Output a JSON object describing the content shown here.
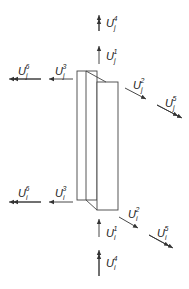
{
  "diagram": {
    "stroke_color": "#333333",
    "top_node": {
      "subscript": "j",
      "labels": [
        {
          "id": "U4",
          "base": "U",
          "sub": "j",
          "sup": "4",
          "direction": "up",
          "arrow": "double"
        },
        {
          "id": "U1",
          "base": "U",
          "sub": "j",
          "sup": "1",
          "direction": "up",
          "arrow": "single"
        },
        {
          "id": "U6",
          "base": "U",
          "sub": "j",
          "sup": "6",
          "direction": "left",
          "arrow": "double"
        },
        {
          "id": "U3",
          "base": "U",
          "sub": "j",
          "sup": "3",
          "direction": "left",
          "arrow": "single"
        },
        {
          "id": "U2",
          "base": "U",
          "sub": "j",
          "sup": "2",
          "direction": "down-right",
          "arrow": "single"
        },
        {
          "id": "U5",
          "base": "U",
          "sub": "j",
          "sup": "5",
          "direction": "down-right",
          "arrow": "double"
        }
      ]
    },
    "bottom_node": {
      "subscript": "i",
      "labels": [
        {
          "id": "U6",
          "base": "U",
          "sub": "i",
          "sup": "6",
          "direction": "left",
          "arrow": "double"
        },
        {
          "id": "U3",
          "base": "U",
          "sub": "i",
          "sup": "3",
          "direction": "left",
          "arrow": "single"
        },
        {
          "id": "U2",
          "base": "U",
          "sub": "i",
          "sup": "2",
          "direction": "down-right",
          "arrow": "single"
        },
        {
          "id": "U5",
          "base": "U",
          "sub": "i",
          "sup": "5",
          "direction": "down-right",
          "arrow": "double"
        },
        {
          "id": "U1",
          "base": "U",
          "sub": "i",
          "sup": "1",
          "direction": "up",
          "arrow": "single"
        },
        {
          "id": "U4",
          "base": "U",
          "sub": "i",
          "sup": "4",
          "direction": "up",
          "arrow": "double"
        }
      ]
    }
  }
}
